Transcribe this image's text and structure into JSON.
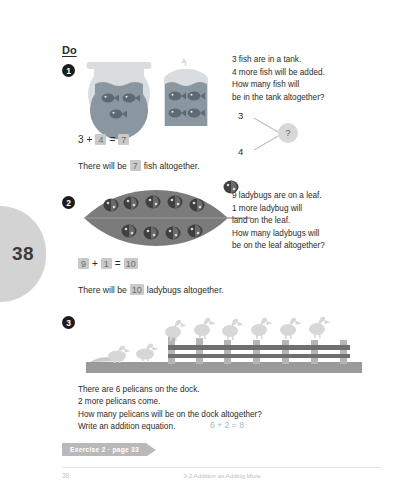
{
  "page": {
    "side_tab_number": "38",
    "footer_number": "38",
    "footer_text": "3-2  Addition as Adding More"
  },
  "heading": {
    "label": "Do"
  },
  "colors": {
    "water": "#8b97a0",
    "glass": "#d9dde0",
    "leaf": "#7b7b7b",
    "dock": "#9a9a9a",
    "rail": "#6f6f6f",
    "pelican": "#d7d7d7",
    "answer_box_bg": "#c9c9c9",
    "banner_bg": "#b9b9b9",
    "side_tab_bg": "#d3d3d3",
    "equation_blue": "#9fb9cc"
  },
  "exercises": [
    {
      "number": "1",
      "story": "3 fish are in a tank.\n4 more fish will be added.\nHow many fish will\nbe in the tank altogether?",
      "bond": {
        "top": "3",
        "bottom": "4",
        "total": "?"
      },
      "equation": {
        "a": "3",
        "op": "+",
        "b": "4",
        "eq": "=",
        "c": "7"
      },
      "equation_filled": {
        "b": true,
        "c": true
      },
      "sentence_before": "There will be",
      "sentence_answer": "7",
      "sentence_after": "fish altogether.",
      "art": {
        "bowl_fish": 3,
        "tank_fish": 4
      }
    },
    {
      "number": "2",
      "story": "9 ladybugs are on a leaf.\n1 more ladybug will\nland on the leaf.\nHow many ladybugs will\nbe on the leaf altogether?",
      "equation": {
        "a": "9",
        "op": "+",
        "b": "1",
        "eq": "=",
        "c": "10"
      },
      "equation_filled": {
        "a": true,
        "b": true,
        "c": true
      },
      "sentence_before": "There will be",
      "sentence_answer": "10",
      "sentence_after": "ladybugs altogether.",
      "art": {
        "leaf_ladybugs_top": 5,
        "leaf_ladybugs_bottom": 4,
        "extra_ladybug": 1
      }
    },
    {
      "number": "3",
      "story": "There are 6 pelicans on the dock.\n2 more pelicans come.\nHow many pelicans will be on the dock altogether?\nWrite an addition equation.",
      "equation_text": "6 + 2 = 8",
      "art": {
        "pelicans_on_posts": 6,
        "pelicans_on_dock": 2
      }
    }
  ],
  "banner": {
    "label": "Exercise 2 · page 33"
  }
}
